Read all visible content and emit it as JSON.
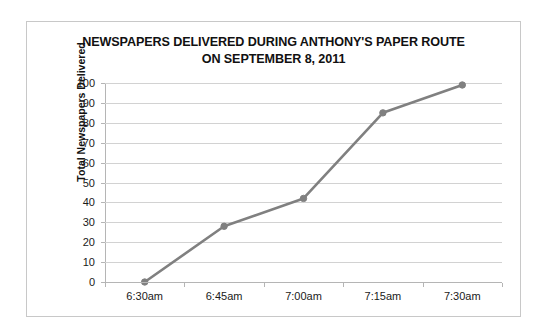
{
  "chart_data": {
    "type": "line",
    "title": "NEWSPAPERS DELIVERED DURING ANTHONY'S PAPER ROUTE ON SEPTEMBER 8, 2011",
    "title_line1": "NEWSPAPERS DELIVERED DURING ANTHONY'S PAPER ROUTE",
    "title_line2": "ON SEPTEMBER 8, 2011",
    "xlabel": "",
    "ylabel": "Total Newspapers Delivered",
    "categories": [
      "6:30am",
      "6:45am",
      "7:00am",
      "7:15am",
      "7:30am"
    ],
    "values": [
      0,
      28,
      42,
      85,
      99
    ],
    "series": [
      {
        "name": "Total Newspapers Delivered",
        "values": [
          0,
          28,
          42,
          85,
          99
        ]
      }
    ],
    "ylim": [
      0,
      100
    ],
    "ytick_labels": [
      "100",
      "90",
      "80",
      "70",
      "60",
      "50",
      "40",
      "30",
      "20",
      "10",
      "0"
    ],
    "ytick_values": [
      100,
      90,
      80,
      70,
      60,
      50,
      40,
      30,
      20,
      10,
      0
    ],
    "ytick_step": 10,
    "grid": "horizontal",
    "legend": "none",
    "line_color": "#808080",
    "marker_color": "#808080",
    "gridline_color": "#d2d2d2",
    "axis_color": "#b5b5b5",
    "background_color": "#ffffff",
    "border_color": "#c8c8c8"
  }
}
